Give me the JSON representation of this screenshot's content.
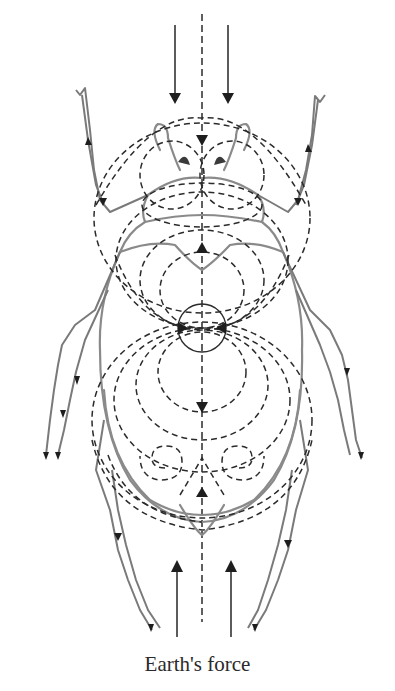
{
  "figure": {
    "caption": "Earth's force",
    "colors": {
      "background": "#ffffff",
      "field_lines": "#2b2b2b",
      "beetle_outline": "#8a8a8a",
      "caption_text": "#2a2a2a"
    },
    "elements": {
      "top_arrows": {
        "count": 2,
        "direction": "down"
      },
      "bottom_arrows": {
        "count": 2,
        "direction": "up"
      },
      "central_axis": "dashed vertical line",
      "center_circle": "small solid circle at body center",
      "field_loops": "nested dashed ellipses above and below center",
      "spirals": 2
    }
  }
}
